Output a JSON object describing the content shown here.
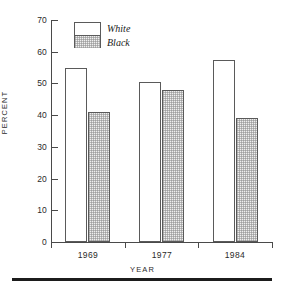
{
  "chart_data": {
    "type": "bar",
    "title": "",
    "subtitle": "",
    "xlabel": "YEAR",
    "ylabel": "PERCENT",
    "categories": [
      "1969",
      "1977",
      "1984"
    ],
    "series": [
      {
        "name": "White",
        "values": [
          55,
          50.5,
          57.5
        ],
        "style": "open-white"
      },
      {
        "name": "Black",
        "values": [
          41,
          48,
          39
        ],
        "style": "gray-halftone"
      }
    ],
    "ylim": [
      0,
      70
    ],
    "yticks": [
      0,
      10,
      20,
      30,
      40,
      50,
      60,
      70
    ],
    "ytick_labels": [
      "0",
      "10",
      "20",
      "30",
      "40",
      "50",
      "60",
      "70"
    ],
    "grid": false,
    "legend_position": "upper-left-inside",
    "legend_entries": [
      "White",
      "Black"
    ],
    "annotations": [],
    "colors": {
      "white_bar_fill": "#ffffff",
      "black_bar_fill": "#efefef",
      "bar_outline": "#5a5a5a",
      "axis": "#4a4a4a",
      "text": "#1a1a1a",
      "rule": "#1c1c1c",
      "background": "#ffffff"
    }
  },
  "figure": {
    "bottom_rule": ""
  }
}
